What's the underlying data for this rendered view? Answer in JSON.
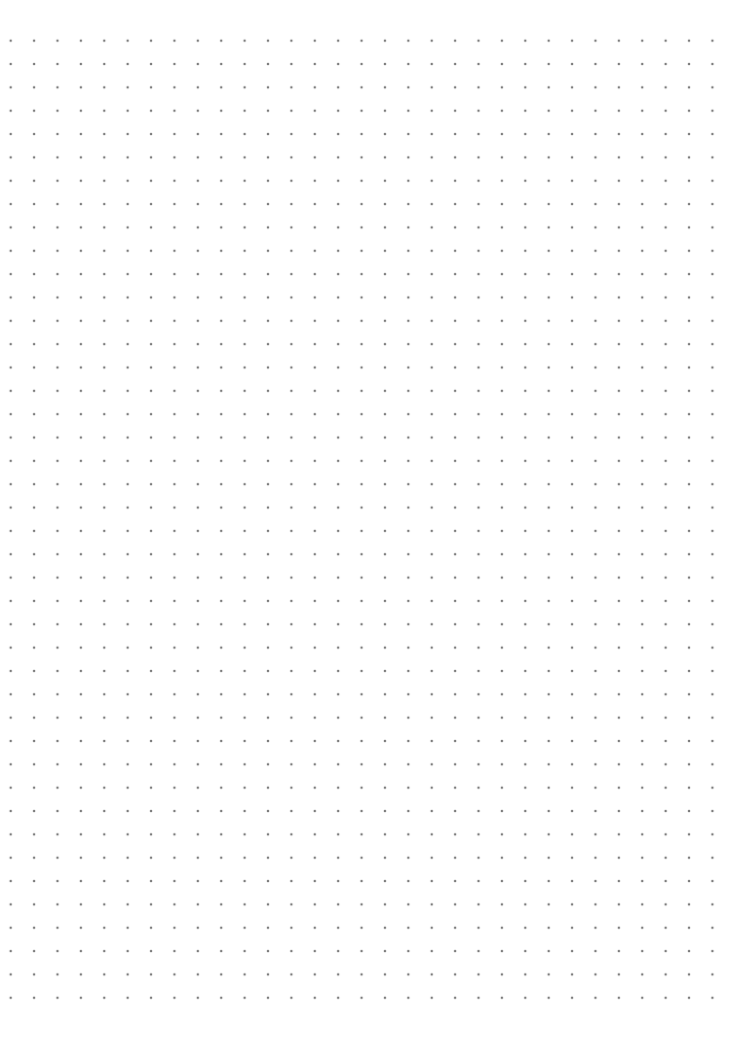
{
  "page": {
    "type": "dot-grid-paper",
    "background_color": "#ffffff",
    "dot_color": "#7a7a7a",
    "grid": {
      "columns": 31,
      "rows": 42,
      "spacing_x_px": 23.4,
      "spacing_y_px": 23.35,
      "first_dot": {
        "x": 11,
        "y": 41
      },
      "dot_diameter_px": 2
    }
  }
}
